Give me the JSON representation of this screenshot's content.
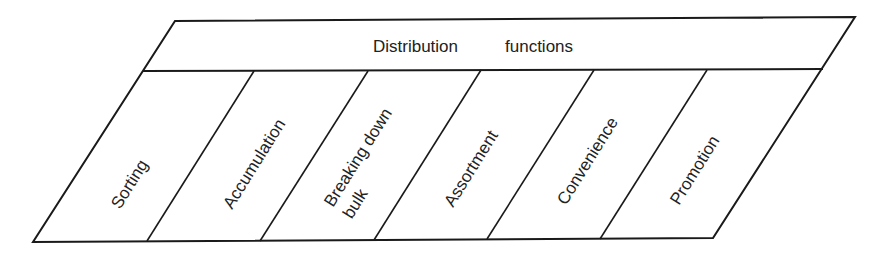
{
  "diagram": {
    "title_word1": "Distribution",
    "title_word2": "functions",
    "items": [
      {
        "line1": "Sorting",
        "line2": ""
      },
      {
        "line1": "Accumulation",
        "line2": ""
      },
      {
        "line1": "Breaking down",
        "line2": "bulk"
      },
      {
        "line1": "Assortment",
        "line2": ""
      },
      {
        "line1": "Convenience",
        "line2": ""
      },
      {
        "line1": "Promotion",
        "line2": ""
      }
    ],
    "colors": {
      "stroke": "#1a1a1a",
      "text": "#222222",
      "background": "#ffffff"
    }
  }
}
